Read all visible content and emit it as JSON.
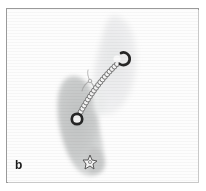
{
  "figure": {
    "panel_label": "b",
    "modality": "grayscale-scan",
    "background_color": "#ffffff",
    "frame_color": "#9a9a9a",
    "canvas_color": "#fdfdfd"
  },
  "structures": [
    {
      "id": "upper-structure",
      "name": "upper-elongated-structure",
      "fill_color": "#eceeee",
      "edge_color": "#dcdede",
      "opacity": 0.95,
      "centroid": [
        112,
        58
      ],
      "orientation_deg": 28,
      "length": 96,
      "width": 34,
      "outline_points": "104,14 116,16 124,25 129,40 130,56 127,72 120,85 112,95 104,101 97,100 93,92 93,78 95,60 97,42 99,26"
    },
    {
      "id": "lower-structure",
      "name": "lower-elongated-structure",
      "fill_color": "#c6c8c8",
      "edge_color": "#b4b6b6",
      "opacity": 0.95,
      "centroid": [
        75,
        115
      ],
      "orientation_deg": 8,
      "length": 104,
      "width": 36,
      "outline_points": "64,72 73,70 80,76 85,88 88,102 90,116 92,128 95,138 96,148 94,158 88,164 80,164 73,157 67,145 62,130 58,114 56,98 57,84"
    }
  ],
  "markers": [
    {
      "id": "upper-ring-marker",
      "name": "upper-ring-marker",
      "shape": "open-ring",
      "color": "#2b2b2b",
      "cx": 118,
      "cy": 58,
      "r": 6.2,
      "stroke_width": 2.6,
      "gap_deg": 55
    },
    {
      "id": "lower-ring-marker",
      "name": "lower-ring-marker",
      "shape": "ring",
      "color": "#2b2b2b",
      "cx": 77,
      "cy": 118,
      "r": 5.4,
      "stroke_width": 2.8
    },
    {
      "id": "distal-star-marker",
      "name": "distal-star-marker",
      "shape": "star",
      "color": "#555555",
      "fill": "#f4f4f4",
      "cx": 88,
      "cy": 160,
      "r": 6
    }
  ],
  "chain": {
    "id": "beaded-chain",
    "name": "beaded-chain-connector",
    "bead_color": "#f6f6f6",
    "bead_edge_color": "#6f6f6f",
    "bead_radius": 2.5,
    "bead_count": 19,
    "start": [
      79,
      115
    ],
    "end": [
      117,
      64
    ],
    "control": [
      94,
      86
    ]
  },
  "branch": {
    "id": "side-branch",
    "name": "chain-side-branch",
    "color": "#9b9b9b",
    "path": "M 90 78 C 86 80 83 83 82 87 M 90 78 C 93 80 95 84 95 88 M 90 78 C 88 74 87 70 88 67"
  }
}
